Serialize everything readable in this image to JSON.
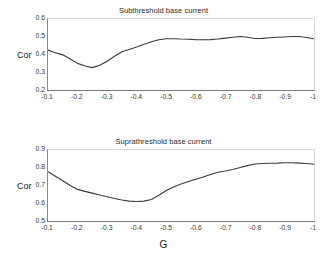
{
  "figure": {
    "background": "#ffffff",
    "line_color": "#3a3a3a",
    "axis_color": "#8a8a8a",
    "grid": false,
    "xlabel": "G",
    "ylabel": "Cor"
  },
  "panels": [
    {
      "key": "subthreshold",
      "title": "Subthreshold base current",
      "ylabel": "Cor",
      "yticks": [
        "0.6",
        "0.5",
        "0.4",
        "0.3",
        "0.2"
      ],
      "xticks": [
        "-0.1",
        "-0.2",
        "-0.3",
        "-0.4",
        "-0.5",
        "-0.6",
        "-0.7",
        "-0.8",
        "-0.9",
        "-1"
      ]
    },
    {
      "key": "suprathreshold",
      "title": "Suprathreshold base current",
      "ylabel": "Cor",
      "yticks": [
        "0.9",
        "0.8",
        "0.7",
        "0.6",
        "0.5"
      ],
      "xticks": [
        "-0.1",
        "-0.2",
        "-0.3",
        "-0.4",
        "-0.5",
        "-0.6",
        "-0.7",
        "-0.8",
        "-0.9",
        "-1"
      ],
      "xlabel": "G"
    }
  ],
  "chart_data": [
    {
      "type": "line",
      "title": "Subthreshold base current",
      "xlabel": "",
      "ylabel": "Cor",
      "xlim": [
        -0.1,
        -1.0
      ],
      "ylim": [
        0.2,
        0.6
      ],
      "yticks": [
        0.2,
        0.3,
        0.4,
        0.5,
        0.6
      ],
      "xticks": [
        -0.1,
        -0.2,
        -0.3,
        -0.4,
        -0.5,
        -0.6,
        -0.7,
        -0.8,
        -0.9,
        -1.0
      ],
      "grid": false,
      "legend": null,
      "series": [
        {
          "name": "Cor",
          "x": [
            -0.1,
            -0.125,
            -0.15,
            -0.175,
            -0.2,
            -0.225,
            -0.25,
            -0.275,
            -0.3,
            -0.325,
            -0.35,
            -0.375,
            -0.4,
            -0.425,
            -0.45,
            -0.475,
            -0.5,
            -0.525,
            -0.55,
            -0.575,
            -0.6,
            -0.625,
            -0.65,
            -0.675,
            -0.7,
            -0.725,
            -0.75,
            -0.775,
            -0.8,
            -0.825,
            -0.85,
            -0.875,
            -0.9,
            -0.925,
            -0.95,
            -0.975,
            -1.0
          ],
          "y": [
            0.425,
            0.41,
            0.398,
            0.375,
            0.35,
            0.335,
            0.326,
            0.34,
            0.362,
            0.39,
            0.415,
            0.428,
            0.442,
            0.458,
            0.472,
            0.483,
            0.489,
            0.489,
            0.487,
            0.486,
            0.484,
            0.483,
            0.484,
            0.487,
            0.492,
            0.497,
            0.501,
            0.497,
            0.49,
            0.491,
            0.494,
            0.497,
            0.499,
            0.501,
            0.501,
            0.496,
            0.489
          ]
        }
      ]
    },
    {
      "type": "line",
      "title": "Suprathreshold base current",
      "xlabel": "G",
      "ylabel": "Cor",
      "xlim": [
        -0.1,
        -1.0
      ],
      "ylim": [
        0.5,
        0.9
      ],
      "yticks": [
        0.5,
        0.6,
        0.7,
        0.8,
        0.9
      ],
      "xticks": [
        -0.1,
        -0.2,
        -0.3,
        -0.4,
        -0.5,
        -0.6,
        -0.7,
        -0.8,
        -0.9,
        -1.0
      ],
      "grid": false,
      "legend": null,
      "series": [
        {
          "name": "Cor",
          "x": [
            -0.1,
            -0.125,
            -0.15,
            -0.175,
            -0.2,
            -0.225,
            -0.25,
            -0.275,
            -0.3,
            -0.325,
            -0.35,
            -0.375,
            -0.4,
            -0.425,
            -0.45,
            -0.475,
            -0.5,
            -0.525,
            -0.55,
            -0.575,
            -0.6,
            -0.625,
            -0.65,
            -0.675,
            -0.7,
            -0.725,
            -0.75,
            -0.775,
            -0.8,
            -0.825,
            -0.85,
            -0.875,
            -0.9,
            -0.925,
            -0.95,
            -0.975,
            -1.0
          ],
          "y": [
            0.778,
            0.752,
            0.727,
            0.7,
            0.678,
            0.667,
            0.657,
            0.646,
            0.637,
            0.627,
            0.618,
            0.612,
            0.61,
            0.612,
            0.621,
            0.645,
            0.672,
            0.692,
            0.708,
            0.722,
            0.735,
            0.748,
            0.762,
            0.775,
            0.782,
            0.79,
            0.801,
            0.812,
            0.821,
            0.824,
            0.825,
            0.826,
            0.828,
            0.828,
            0.826,
            0.824,
            0.82
          ]
        }
      ]
    }
  ]
}
